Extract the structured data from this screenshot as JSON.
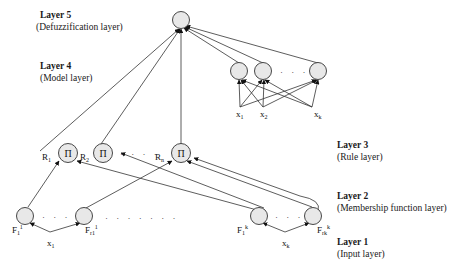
{
  "layers": [
    {
      "title": "Layer 5",
      "subtitle": "(Defuzzification layer)"
    },
    {
      "title": "Layer 4",
      "subtitle": "(Model layer)"
    },
    {
      "title": "Layer 3",
      "subtitle": "(Rule layer)"
    },
    {
      "title": "Layer 2",
      "subtitle": "(Membership function layer)"
    },
    {
      "title": "Layer 1",
      "subtitle": "(Input layer)"
    }
  ],
  "rule_nodes": [
    {
      "symbol": "Π",
      "label": "R",
      "sub": "1"
    },
    {
      "symbol": "Π",
      "label": "R",
      "sub": "2"
    },
    {
      "symbol": "Π",
      "label": "R",
      "sub": "n"
    }
  ],
  "mf_nodes": [
    {
      "label": "F",
      "sub": "1",
      "sup": "1"
    },
    {
      "label": "F",
      "sub": "r1",
      "sup": "1"
    },
    {
      "label": "F",
      "sub": "1",
      "sup": "k"
    },
    {
      "label": "F",
      "sub": "rk",
      "sup": "k"
    }
  ],
  "inputs_bottom": [
    {
      "label": "x",
      "sub": "1"
    },
    {
      "label": "x",
      "sub": "k"
    }
  ],
  "inputs_model": [
    {
      "label": "x",
      "sub": "1"
    },
    {
      "label": "x",
      "sub": "2"
    },
    {
      "label": "x",
      "sub": "k"
    }
  ],
  "ellipsis": "· · · ·",
  "ellipsis_short": "· · ·",
  "ellipsis_long": "· · · · · · ·"
}
